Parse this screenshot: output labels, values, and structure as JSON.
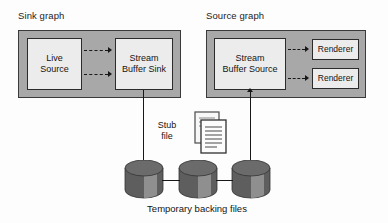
{
  "diagram": {
    "sink_graph": {
      "title": "Sink graph",
      "nodes": [
        {
          "id": "live-source",
          "label": "Live\nSource"
        },
        {
          "id": "stream-buffer-sink",
          "label": "Stream\nBuffer Sink"
        }
      ],
      "connector_count": 2
    },
    "source_graph": {
      "title": "Source graph",
      "nodes": [
        {
          "id": "stream-buffer-source",
          "label": "Stream\nBuffer Source"
        },
        {
          "id": "renderer-top",
          "label": "Renderer"
        },
        {
          "id": "renderer-bottom",
          "label": "Renderer"
        }
      ],
      "connector_count": 2
    },
    "stub": {
      "label": "Stub\nfile",
      "icon": "document-stack-icon"
    },
    "storage": {
      "caption": "Temporary backing files",
      "items": [
        {
          "id": "backing-file-1",
          "icon": "cylinder-icon"
        },
        {
          "id": "backing-file-2",
          "icon": "cylinder-icon"
        },
        {
          "id": "backing-file-3",
          "icon": "cylinder-icon"
        }
      ]
    },
    "colors": {
      "container_fill": "#a8a8a8",
      "node_fill": "#ececec",
      "stroke": "#2b2b2b",
      "cylinder_dark": "#595959",
      "cylinder_light": "#8d8d8d",
      "background": "#fdfdfd"
    }
  }
}
